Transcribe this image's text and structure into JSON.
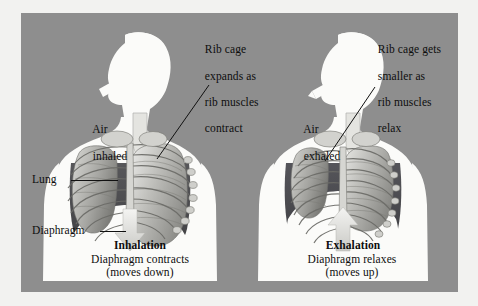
{
  "diagram": {
    "background_color": "#8e8e8e",
    "panel_shadow_color": "#b9b9b7",
    "page_color": "#f2f2f0",
    "text_color": "#0d0d0d"
  },
  "left_panel": {
    "air_label_line1": "Air",
    "air_label_line2": "inhaled",
    "ribcage_note_line1": "Rib cage",
    "ribcage_note_line2": "expands as",
    "ribcage_note_line3": "rib muscles",
    "ribcage_note_line4": "contract",
    "lung_label": "Lung",
    "diaphragm_label": "Diaphragm",
    "phase_title": "Inhalation",
    "phase_desc_line1": "Diaphragm contracts",
    "phase_desc_line2": "(moves down)",
    "arrow_direction": "down",
    "arrow_icon": "arrow-down-icon",
    "air_arrow_icon": "air-inflow-arrow-icon"
  },
  "right_panel": {
    "air_label_line1": "Air",
    "air_label_line2": "exhaled",
    "ribcage_note_line1": "Rib cage gets",
    "ribcage_note_line2": "smaller as",
    "ribcage_note_line3": "rib muscles",
    "ribcage_note_line4": "relax",
    "phase_title": "Exhalation",
    "phase_desc_line1": "Diaphragm relaxes",
    "phase_desc_line2": "(moves up)",
    "arrow_direction": "up",
    "arrow_icon": "arrow-up-icon",
    "air_arrow_icon": "air-outflow-arrow-icon"
  }
}
